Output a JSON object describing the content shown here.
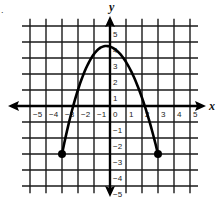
{
  "problem_fragment": ".",
  "chart_data": {
    "type": "line",
    "title": "",
    "xlabel": "x",
    "ylabel": "y",
    "xlim": [
      -5,
      5
    ],
    "ylim": [
      -5,
      5
    ],
    "grid": true,
    "x_ticks": [
      "-5",
      "-4",
      "-3",
      "-2",
      "-1",
      "0",
      "1",
      "2",
      "3",
      "4",
      "5"
    ],
    "y_ticks": [
      "5",
      "4",
      "3",
      "2",
      "1",
      "-1",
      "-2",
      "-3",
      "-4",
      "-5"
    ],
    "series": [
      {
        "name": "parabola",
        "shape": "downward parabola",
        "vertex": [
          -0.25,
          3.75
        ],
        "endpoints": [
          [
            -3,
            -3
          ],
          [
            3,
            -3
          ]
        ],
        "endpoint_style": "closed-dot",
        "x": [
          -3,
          -2.5,
          -2,
          -1.5,
          -1,
          -0.5,
          0,
          0.5,
          1,
          1.5,
          2,
          2.5,
          3
        ],
        "y": [
          -3,
          -1.3,
          0.3,
          1.8,
          2.9,
          3.6,
          3.7,
          3.3,
          2.7,
          1.6,
          0.2,
          -1.4,
          -3
        ]
      }
    ],
    "colors": {
      "grid": "#1a1a1a",
      "curve": "#000000",
      "background": "#ffffff"
    }
  },
  "labels": {
    "x_axis": "x",
    "y_axis": "y",
    "x_ticks": [
      "-5",
      "-4",
      "-3",
      "-2",
      "-1",
      "0",
      "1",
      "2",
      "3",
      "4",
      "5"
    ],
    "y_pos_ticks": [
      "5",
      "4",
      "3",
      "2",
      "1"
    ],
    "y_neg_ticks": [
      "-1",
      "-2",
      "-3",
      "-4",
      "-5"
    ]
  }
}
